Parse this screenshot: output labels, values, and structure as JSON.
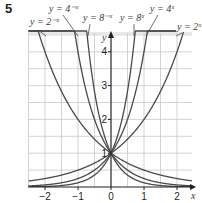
{
  "question_number": "5",
  "chart_data": {
    "type": "line",
    "title": "",
    "xlabel": "x",
    "ylabel": "y",
    "xlim": [
      -2.5,
      2.45
    ],
    "ylim": [
      0,
      4.5
    ],
    "grid": true,
    "grid_step": 0.5,
    "x_ticks": [
      -2,
      -1,
      0,
      1,
      2
    ],
    "x_tick_labels": [
      "−2",
      "−1",
      "0",
      "1",
      "2"
    ],
    "y_ticks": [
      1,
      2,
      3,
      4
    ],
    "y_tick_labels": [
      "1",
      "2",
      "3",
      "4"
    ],
    "series": [
      {
        "name": "y = 2^-x",
        "label": "y = 2⁻ˣ",
        "base": 2,
        "sign": -1
      },
      {
        "name": "y = 4^-x",
        "label": "y = 4⁻ˣ",
        "base": 4,
        "sign": -1
      },
      {
        "name": "y = 8^-x",
        "label": "y = 8⁻ˣ",
        "base": 8,
        "sign": -1
      },
      {
        "name": "y = 8^x",
        "label": "y = 8ˣ",
        "base": 8,
        "sign": 1
      },
      {
        "name": "y = 4^x",
        "label": "y = 4ˣ",
        "base": 4,
        "sign": 1
      },
      {
        "name": "y = 2^x",
        "label": "y = 2ˣ",
        "base": 2,
        "sign": 1
      }
    ],
    "annotations": [
      {
        "text": "y = 2⁻ˣ",
        "x": 30,
        "y": 25,
        "leader": [
          [
            38,
            30
          ],
          [
            46,
            36
          ]
        ]
      },
      {
        "text": "y = 4⁻ˣ",
        "x": 49,
        "y": 12,
        "leader": [
          [
            63,
            15
          ],
          [
            78,
            36
          ]
        ]
      },
      {
        "text": "y = 8⁻ˣ",
        "x": 83,
        "y": 21,
        "leader": [
          [
            90,
            24
          ],
          [
            88,
            36
          ]
        ]
      },
      {
        "text": "y = 8ˣ",
        "x": 120,
        "y": 21,
        "leader": [
          [
            134,
            24
          ],
          [
            134,
            36
          ]
        ]
      },
      {
        "text": "y = 4ˣ",
        "x": 150,
        "y": 12,
        "leader": [
          [
            158,
            15
          ],
          [
            146,
            36
          ]
        ]
      },
      {
        "text": "y = 2ˣ",
        "x": 177,
        "y": 30,
        "leader": [
          [
            182,
            33
          ],
          [
            176,
            36
          ]
        ]
      }
    ],
    "intersection": {
      "x": 0,
      "y": 1
    }
  },
  "colors": {
    "grid": "#c8c8c8",
    "axis": "#231f20",
    "curve": "#4a4a4a"
  }
}
